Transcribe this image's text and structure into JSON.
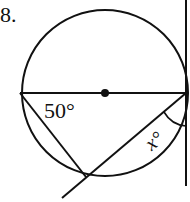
{
  "problem": {
    "number": "8.",
    "angle_label_left": "50°",
    "angle_label_right": "x°"
  },
  "diagram": {
    "circle": {
      "cx": 105,
      "cy": 93,
      "r": 83
    },
    "stroke_color": "#111111",
    "diameter": {
      "x1": 22,
      "y1": 93,
      "x2": 186,
      "y2": 93
    },
    "center_dot": {
      "cx": 105,
      "cy": 93,
      "r": 4
    },
    "chord_left": {
      "x1": 22,
      "y1": 93,
      "x2": 86,
      "y2": 177
    },
    "secant": {
      "x1": 186,
      "y1": 93,
      "x2": 62,
      "y2": 198
    },
    "tangent": {
      "x1": 186,
      "y1": 0,
      "x2": 186,
      "y2": 186
    }
  }
}
